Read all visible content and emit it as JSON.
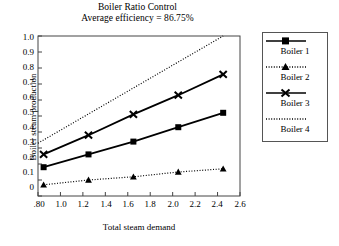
{
  "chart_data": {
    "type": "line",
    "title": "Boiler Ratio Control",
    "subtitle": "Average efficiency = 86.75%",
    "xlabel": "Total steam demand",
    "ylabel": "Boiler steam production",
    "xlim": [
      0.8,
      2.6
    ],
    "ylim": [
      0,
      1.0
    ],
    "grid": false,
    "legend_position": "right-outside",
    "x": [
      0.85,
      1.25,
      1.65,
      2.05,
      2.45
    ],
    "xticks": [
      ".80",
      "1.0",
      "1.2",
      "1.4",
      "1.6",
      "1.8",
      "2.0",
      "2.2",
      "2.4",
      "2.6"
    ],
    "xtick_values": [
      0.8,
      1.0,
      1.2,
      1.4,
      1.6,
      1.8,
      2.0,
      2.2,
      2.4,
      2.6
    ],
    "yticks": [
      "0",
      "0.1",
      "0.2",
      "0.3",
      "0.4",
      "0.5",
      "0.6",
      "0.7",
      "0.8",
      "0.9",
      "1.0"
    ],
    "ytick_values": [
      0,
      0.1,
      0.2,
      0.3,
      0.4,
      0.5,
      0.6,
      0.7,
      0.8,
      0.9,
      1.0
    ],
    "series": [
      {
        "name": "Boiler 1",
        "marker": "square",
        "line": "solid",
        "values": [
          0.18,
          0.26,
          0.34,
          0.43,
          0.52
        ]
      },
      {
        "name": "Boiler 2",
        "marker": "triangle",
        "line": "dotted",
        "values": [
          0.07,
          0.1,
          0.12,
          0.15,
          0.17
        ]
      },
      {
        "name": "Boiler 3",
        "marker": "x",
        "line": "solid",
        "values": [
          0.26,
          0.38,
          0.51,
          0.63,
          0.76
        ]
      },
      {
        "name": "Boiler 4",
        "marker": "none",
        "line": "dotted",
        "x": [
          0.8,
          2.45
        ],
        "values": [
          0.33,
          1.0
        ]
      }
    ]
  },
  "legend": {
    "entries": [
      {
        "label": "Boiler 1"
      },
      {
        "label": "Boiler 2"
      },
      {
        "label": "Boiler 3"
      },
      {
        "label": "Boiler 4"
      }
    ]
  }
}
